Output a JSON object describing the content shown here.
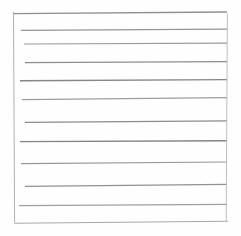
{
  "image": {
    "subject": "lined-notepaper-sheet",
    "description": "Scanned blank sheet of lined writing paper",
    "width": 241,
    "height": 236,
    "background_color": "#ffffff",
    "paper_color": "#fefefe",
    "rule_color": "#9a9a9a",
    "rule_color_light": "#c9c9c9",
    "border_color": "#b4b4b4",
    "rule_count": 12,
    "written_text": ""
  },
  "sheet": {
    "left": 13.5,
    "right": 227.0,
    "top": 12.0,
    "bottom": 222.5,
    "label": "paper-sheet"
  },
  "borders": {
    "left_edge": {
      "name": "left-margin-rule",
      "x1": 13.5,
      "y1": 12.0,
      "x2": 14.6,
      "y2": 222.0,
      "width": 1.0,
      "color": "#b0b0b0"
    },
    "right_edge": {
      "name": "right-margin-rule",
      "x1": 227.4,
      "y1": 13.5,
      "x2": 226.2,
      "y2": 222.0,
      "width": 1.0,
      "color": "#bdbdbd"
    }
  },
  "rules": [
    {
      "index": 1,
      "name": "rule-line-1",
      "x1": 14.0,
      "y1": 13.6,
      "x2": 227.0,
      "y2": 12.0,
      "width": 1.3,
      "color": "#8f8f8f"
    },
    {
      "index": 2,
      "name": "rule-line-2",
      "x1": 21.0,
      "y1": 30.4,
      "x2": 227.0,
      "y2": 29.2,
      "width": 1.2,
      "color": "#959595"
    },
    {
      "index": 3,
      "name": "rule-line-3",
      "x1": 24.0,
      "y1": 44.0,
      "x2": 227.0,
      "y2": 43.2,
      "width": 1.2,
      "color": "#9b9b9b"
    },
    {
      "index": 4,
      "name": "rule-line-4",
      "x1": 25.0,
      "y1": 62.6,
      "x2": 227.0,
      "y2": 61.6,
      "width": 1.2,
      "color": "#8d8d8d"
    },
    {
      "index": 5,
      "name": "rule-line-5",
      "x1": 20.0,
      "y1": 80.8,
      "x2": 227.0,
      "y2": 79.6,
      "width": 1.4,
      "color": "#868686"
    },
    {
      "index": 6,
      "name": "rule-line-6",
      "x1": 22.0,
      "y1": 99.6,
      "x2": 227.0,
      "y2": 97.6,
      "width": 1.2,
      "color": "#9d9d9d"
    },
    {
      "index": 7,
      "name": "rule-line-7",
      "x1": 25.0,
      "y1": 122.4,
      "x2": 227.0,
      "y2": 120.8,
      "width": 1.3,
      "color": "#8b8b8b"
    },
    {
      "index": 8,
      "name": "rule-line-8",
      "x1": 20.0,
      "y1": 141.6,
      "x2": 227.0,
      "y2": 140.8,
      "width": 1.4,
      "color": "#838383"
    },
    {
      "index": 9,
      "name": "rule-line-9",
      "x1": 21.0,
      "y1": 163.6,
      "x2": 227.0,
      "y2": 162.0,
      "width": 1.2,
      "color": "#979797"
    },
    {
      "index": 10,
      "name": "rule-line-10",
      "x1": 25.0,
      "y1": 186.4,
      "x2": 227.0,
      "y2": 184.4,
      "width": 1.2,
      "color": "#909090"
    },
    {
      "index": 11,
      "name": "rule-line-11",
      "x1": 19.0,
      "y1": 205.6,
      "x2": 227.0,
      "y2": 204.4,
      "width": 1.2,
      "color": "#9f9f9f"
    },
    {
      "index": 12,
      "name": "rule-line-12",
      "x1": 14.0,
      "y1": 223.2,
      "x2": 228.0,
      "y2": 221.2,
      "width": 1.1,
      "color": "#a8a8a8"
    }
  ]
}
